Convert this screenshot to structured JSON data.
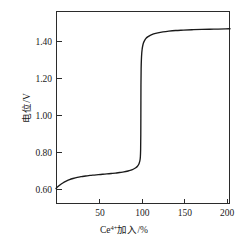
{
  "chart_data": {
    "type": "line",
    "title": "",
    "subtitle": "",
    "xlabel": "Ce4+加入/%",
    "xlabel_base": "Ce",
    "xlabel_sup": "4+",
    "xlabel_rest": "加入/%",
    "ylabel": "电位/V",
    "xlim": [
      0,
      205
    ],
    "ylim": [
      0.52,
      1.52
    ],
    "xticks": [
      50,
      100,
      150,
      200
    ],
    "xtick_labels": [
      "50",
      "100",
      "150",
      "200"
    ],
    "yticks": [
      0.6,
      0.8,
      1.0,
      1.2,
      1.4
    ],
    "ytick_labels": [
      "0.60",
      "0.80",
      "1.00",
      "1.20",
      "1.40"
    ],
    "grid": false,
    "legend": false,
    "legend_position": "none",
    "series": [
      {
        "name": "电位滴定曲线",
        "color": "#1a1a1a",
        "x": [
          0,
          2,
          5,
          8,
          12,
          16,
          20,
          25,
          30,
          35,
          40,
          45,
          50,
          55,
          60,
          65,
          70,
          75,
          80,
          85,
          88,
          91,
          94,
          96,
          97,
          98,
          99,
          99.4,
          99.7,
          99.9,
          100,
          100.1,
          100.3,
          100.6,
          101,
          101.5,
          102,
          103,
          104,
          106,
          108,
          111,
          115,
          120,
          126,
          133,
          141,
          150,
          160,
          172,
          186,
          200,
          205
        ],
        "y": [
          0.6,
          0.609,
          0.62,
          0.629,
          0.638,
          0.646,
          0.652,
          0.658,
          0.662,
          0.665,
          0.668,
          0.67,
          0.672,
          0.674,
          0.676,
          0.678,
          0.68,
          0.683,
          0.686,
          0.691,
          0.695,
          0.7,
          0.708,
          0.716,
          0.722,
          0.731,
          0.748,
          0.765,
          0.8,
          0.88,
          1.01,
          1.14,
          1.22,
          1.268,
          1.3,
          1.322,
          1.336,
          1.354,
          1.364,
          1.378,
          1.386,
          1.394,
          1.401,
          1.407,
          1.412,
          1.416,
          1.419,
          1.421,
          1.423,
          1.425,
          1.426,
          1.427,
          1.428
        ]
      }
    ],
    "annotations": [],
    "equivalence_point": {
      "x": 100,
      "label": ""
    },
    "colors": {
      "curve": "#1a1a1a",
      "axis": "#2b2b2b",
      "background": "#ffffff",
      "text": "#1a1a1a"
    }
  },
  "figure": {
    "plot_area": {
      "left": 56,
      "right": 230,
      "top": 11,
      "bottom": 204
    }
  }
}
